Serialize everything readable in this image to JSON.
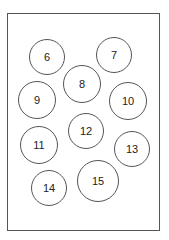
{
  "diagram": {
    "frame_color": "#555555",
    "circles": [
      {
        "label": "6",
        "cx": 47,
        "cy": 57,
        "r": 18
      },
      {
        "label": "7",
        "cx": 114,
        "cy": 55,
        "r": 18
      },
      {
        "label": "8",
        "cx": 82,
        "cy": 84,
        "r": 19
      },
      {
        "label": "9",
        "cx": 37,
        "cy": 100,
        "r": 19
      },
      {
        "label": "10",
        "cx": 128,
        "cy": 101,
        "r": 19
      },
      {
        "label": "11",
        "cx": 39,
        "cy": 145,
        "r": 19
      },
      {
        "label": "12",
        "cx": 86,
        "cy": 131,
        "r": 18
      },
      {
        "label": "13",
        "cx": 132,
        "cy": 149,
        "r": 18
      },
      {
        "label": "14",
        "cx": 49,
        "cy": 188,
        "r": 18
      },
      {
        "label": "15",
        "cx": 98,
        "cy": 181,
        "r": 21
      }
    ]
  }
}
